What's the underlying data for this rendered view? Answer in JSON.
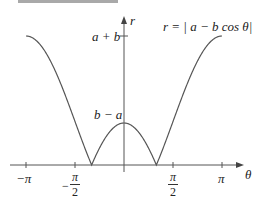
{
  "header": {
    "banner_text": ""
  },
  "figure": {
    "equation": "r = | a − b cos θ|",
    "y_axis_label": "r",
    "x_axis_label": "θ",
    "y_ticks": [
      {
        "label": "a + b",
        "value": "a+b"
      },
      {
        "label": "b − a",
        "value": "b-a"
      }
    ],
    "x_ticks": [
      {
        "label": "−π"
      },
      {
        "label_num": "π",
        "label_den": "2",
        "sign": "−"
      },
      {
        "label_num": "π",
        "label_den": "2",
        "sign": ""
      },
      {
        "label": "π"
      }
    ],
    "colors": {
      "curve": "#555555",
      "axis": "#555555",
      "banner": "#a9a9a9"
    }
  },
  "chart_data": {
    "type": "line",
    "xlabel": "θ",
    "ylabel": "r",
    "xlim": [
      -3.3,
      3.6
    ],
    "x_ticks": [
      "−π",
      "−π/2",
      "π/2",
      "π"
    ],
    "y_ticks": [
      "b − a",
      "a + b"
    ],
    "series": [
      {
        "name": "r = |a − b cos θ| (example a≈0.51b)",
        "x": [
          -3.1416,
          -2.3562,
          -1.5708,
          -1.03,
          -0.7854,
          0,
          0.7854,
          1.03,
          1.5708,
          2.3562,
          3.1416
        ],
        "y": [
          "a+b",
          1.2,
          0.51,
          0,
          0.2,
          "b-a",
          0.2,
          0,
          0.51,
          1.2,
          "a+b"
        ]
      }
    ],
    "annotations": [
      "zeros where cos θ = a/b",
      "maximum a + b at θ = ±π",
      "local max b − a at θ = 0"
    ]
  }
}
